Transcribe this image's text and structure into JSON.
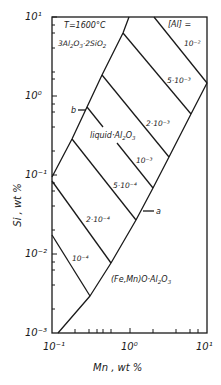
{
  "diagram": {
    "title": "T=1600°C",
    "phase_labels": {
      "mullite": "3Al2O3·2SiO2",
      "liquid": "liquid·Al2O3",
      "spinel": "(Fe,Mn)O·Al2O3"
    },
    "legend_header": "[Al] =",
    "iso_lines": [
      {
        "label": "10⁻²"
      },
      {
        "label": "5·10⁻³"
      },
      {
        "label": "2·10⁻³"
      },
      {
        "label": "10⁻³"
      },
      {
        "label": "5·10⁻⁴"
      },
      {
        "label": "2·10⁻⁴"
      },
      {
        "label": "10⁻⁴"
      }
    ],
    "point_markers": [
      "a",
      "b"
    ],
    "x_axis": {
      "label": "Mn , wt %",
      "ticks": [
        "10⁻¹",
        "10⁰",
        "10¹"
      ],
      "scale": "log",
      "range": [
        0.1,
        10
      ]
    },
    "y_axis": {
      "label": "Si , wt %",
      "ticks": [
        "10¹",
        "10⁰",
        "10⁻¹",
        "10⁻²",
        "10⁻³"
      ],
      "scale": "log",
      "range": [
        0.001,
        10
      ]
    }
  }
}
